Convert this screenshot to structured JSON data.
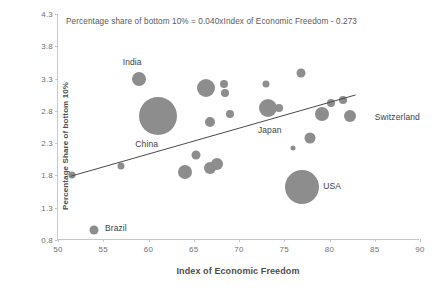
{
  "chart_data": {
    "type": "scatter",
    "title": "",
    "annotation": "Percentage share of bottom  10% = 0.040xIndex of Economic Freedom - 0.273",
    "xlabel": "Index of Economic  Freedom",
    "ylabel": "Percentage Share of bottom 10%",
    "xlim": [
      50,
      90
    ],
    "ylim": [
      0.8,
      4.3
    ],
    "xticks": [
      "50",
      "55",
      "60",
      "65",
      "70",
      "75",
      "80",
      "85",
      "90"
    ],
    "yticks": [
      "0.8",
      "1.3",
      "1.8",
      "2.3",
      "2.8",
      "3.3",
      "3.8",
      "4.3"
    ],
    "grid": false,
    "legend": false,
    "bubble_color": "#8d8d8d",
    "trendline": {
      "slope": 0.04,
      "intercept": -0.273,
      "color": "#4a4a4a",
      "x_start": 51.5,
      "x_end": 83.0
    },
    "points": [
      {
        "label": "Brazil",
        "x": 54.0,
        "y": 0.95,
        "size": 9
      },
      {
        "label": "India",
        "x": 59.0,
        "y": 3.3,
        "size": 14
      },
      {
        "label": "China",
        "x": 61.0,
        "y": 2.72,
        "size": 38
      },
      {
        "label": "",
        "x": 51.5,
        "y": 1.8,
        "size": 7
      },
      {
        "label": "",
        "x": 57.0,
        "y": 1.95,
        "size": 7
      },
      {
        "label": "",
        "x": 64.0,
        "y": 1.85,
        "size": 14
      },
      {
        "label": "",
        "x": 65.3,
        "y": 2.12,
        "size": 9
      },
      {
        "label": "",
        "x": 66.8,
        "y": 1.92,
        "size": 12
      },
      {
        "label": "",
        "x": 67.6,
        "y": 1.98,
        "size": 12
      },
      {
        "label": "",
        "x": 66.3,
        "y": 3.15,
        "size": 18
      },
      {
        "label": "",
        "x": 66.8,
        "y": 2.63,
        "size": 10
      },
      {
        "label": "",
        "x": 68.3,
        "y": 3.22,
        "size": 8
      },
      {
        "label": "",
        "x": 68.4,
        "y": 3.08,
        "size": 8
      },
      {
        "label": "",
        "x": 69.0,
        "y": 2.75,
        "size": 8
      },
      {
        "label": "Japan",
        "x": 73.2,
        "y": 2.85,
        "size": 18
      },
      {
        "label": "",
        "x": 74.4,
        "y": 2.85,
        "size": 8
      },
      {
        "label": "",
        "x": 73.0,
        "y": 3.22,
        "size": 7
      },
      {
        "label": "",
        "x": 76.8,
        "y": 3.38,
        "size": 9
      },
      {
        "label": "",
        "x": 76.0,
        "y": 2.22,
        "size": 5
      },
      {
        "label": "",
        "x": 77.8,
        "y": 2.38,
        "size": 11
      },
      {
        "label": "USA",
        "x": 77.0,
        "y": 1.62,
        "size": 34
      },
      {
        "label": "",
        "x": 79.2,
        "y": 2.75,
        "size": 14
      },
      {
        "label": "",
        "x": 80.2,
        "y": 2.92,
        "size": 8
      },
      {
        "label": "",
        "x": 81.5,
        "y": 2.97,
        "size": 8
      },
      {
        "label": "Switzerland",
        "x": 82.3,
        "y": 2.72,
        "size": 12
      }
    ],
    "point_labels": [
      {
        "text": "India",
        "x": 58.2,
        "y": 3.55
      },
      {
        "text": "China",
        "x": 59.8,
        "y": 2.28
      },
      {
        "text": "Brazil",
        "x": 56.4,
        "y": 0.98
      },
      {
        "text": "Japan",
        "x": 73.4,
        "y": 2.51
      },
      {
        "text": "USA",
        "x": 80.3,
        "y": 1.63
      },
      {
        "text": "Switzerland",
        "x": 87.5,
        "y": 2.7
      }
    ]
  }
}
